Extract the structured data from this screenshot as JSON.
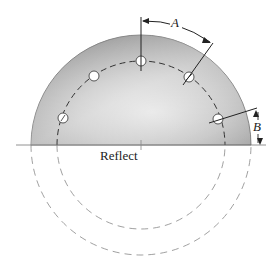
{
  "diagram": {
    "labels": {
      "angle_dimension": "A",
      "offset_dimension": "B",
      "reflect": "Reflect"
    },
    "geometry": {
      "center": [
        141,
        145
      ],
      "outer_radius": 110,
      "bolt_circle_radius": 84,
      "hole_count": 5
    },
    "colors": {
      "disc_light": "#e6e6e6",
      "disc_dark": "#9a9a9a",
      "line": "#222222",
      "dashed": "#555555"
    }
  }
}
